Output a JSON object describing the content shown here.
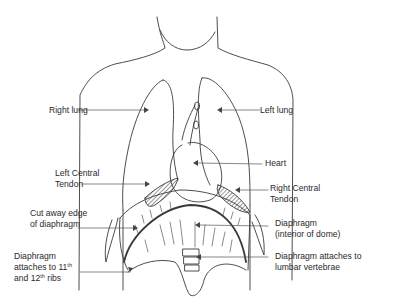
{
  "diagram": {
    "type": "anatomical-sketch",
    "colors": {
      "line": "#3a3a3a",
      "text": "#2a2a2a",
      "background": "#ffffff"
    },
    "labels": {
      "right_lung": "Right lung",
      "left_lung": "Left lung",
      "heart": "Heart",
      "left_central_tendon_1": "Left Central",
      "left_central_tendon_2": "Tendon",
      "right_central_tendon_1": "Right Central",
      "right_central_tendon_2": "Tendon",
      "cut_away_1": "Cut away edge",
      "cut_away_2": "of diaphragm",
      "diaphragm_interior_1": "Diaphragm",
      "diaphragm_interior_2": "(interior of dome)",
      "lumbar_1": "Diaphragm attaches to",
      "lumbar_2": "lumbar vertebrae",
      "ribs_1": "Diaphragm",
      "ribs_2a": "attaches to 11",
      "ribs_2_sup": "th",
      "ribs_3a": "and 12",
      "ribs_3_sup": "th",
      "ribs_3b": " ribs"
    }
  }
}
